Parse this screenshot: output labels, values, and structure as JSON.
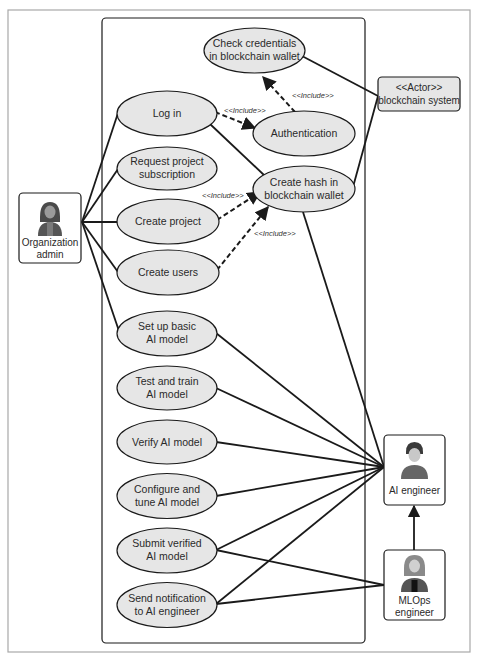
{
  "diagram": {
    "type": "UML use case diagram",
    "colors": {
      "ellipse_fill": "#e6e6e6",
      "stroke": "#1a1a1a",
      "actor_box_fill": "#ffffff",
      "blockchain_box_fill": "#e6e6e6",
      "frame": "#9a9a9a"
    },
    "actors": {
      "org_admin": {
        "label_line1": "Organization",
        "label_line2": "admin",
        "icon": "female-user-icon"
      },
      "blockchain": {
        "label_line1": "<<Actor>>",
        "label_line2": "blockchain system"
      },
      "ai_engineer": {
        "label_line1": "AI engineer",
        "icon": "male-user-icon"
      },
      "mlops_engineer": {
        "label_line1": "MLOps",
        "label_line2": "engineer",
        "icon": "female-user-icon"
      }
    },
    "use_cases": {
      "check_credentials": {
        "line1": "Check credentials",
        "line2": "in blockchain wallet"
      },
      "log_in": {
        "line1": "Log in"
      },
      "authentication": {
        "line1": "Authentication"
      },
      "request_subscription": {
        "line1": "Request project",
        "line2": "subscription"
      },
      "create_hash": {
        "line1": "Create hash in",
        "line2": "blockchain wallet"
      },
      "create_project": {
        "line1": "Create project"
      },
      "create_users": {
        "line1": "Create users"
      },
      "setup_model": {
        "line1": "Set up basic",
        "line2": "AI model"
      },
      "test_train": {
        "line1": "Test and train",
        "line2": "AI model"
      },
      "verify_model": {
        "line1": "Verify AI model"
      },
      "configure_tune": {
        "line1": "Configure and",
        "line2": "tune AI model"
      },
      "submit_verified": {
        "line1": "Submit verified",
        "line2": "AI model"
      },
      "send_notification": {
        "line1": "Send notification",
        "line2": "to AI engineer"
      }
    },
    "include_labels": {
      "login_auth": "<<Include>>",
      "auth_check": "<<Include>>",
      "project_hash": "<<Include>>",
      "users_hash": "<<Include>>"
    },
    "associations": [
      [
        "org_admin",
        "log_in"
      ],
      [
        "org_admin",
        "request_subscription"
      ],
      [
        "org_admin",
        "create_project"
      ],
      [
        "org_admin",
        "create_users"
      ],
      [
        "org_admin",
        "setup_model"
      ],
      [
        "log_in",
        "create_hash"
      ],
      [
        "check_credentials",
        "blockchain"
      ],
      [
        "create_hash",
        "blockchain"
      ],
      [
        "create_hash",
        "ai_engineer"
      ],
      [
        "setup_model",
        "ai_engineer"
      ],
      [
        "test_train",
        "ai_engineer"
      ],
      [
        "verify_model",
        "ai_engineer"
      ],
      [
        "configure_tune",
        "ai_engineer"
      ],
      [
        "submit_verified",
        "ai_engineer"
      ],
      [
        "send_notification",
        "ai_engineer"
      ],
      [
        "submit_verified",
        "mlops_engineer"
      ],
      [
        "send_notification",
        "mlops_engineer"
      ]
    ],
    "generalization": [
      "mlops_engineer",
      "ai_engineer"
    ]
  }
}
